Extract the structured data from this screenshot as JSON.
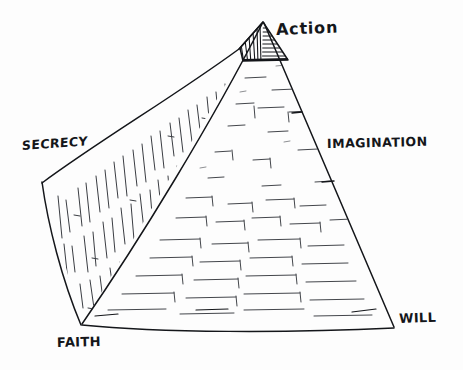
{
  "diagram": {
    "type": "pyramid",
    "style": "hand-drawn ink sketch",
    "background_color": "#fdfdfd",
    "ink_color": "#14161a",
    "labels": {
      "apex": "Action",
      "left_corner": "SECRECY",
      "right_face": "IMAGINATION",
      "bottom_left_corner": "FAITH",
      "bottom_right_corner": "WILL"
    },
    "vertices": {
      "apex": [
        263,
        22
      ],
      "left": [
        42,
        182
      ],
      "front_bottom": [
        82,
        325
      ],
      "right_bottom": [
        394,
        328
      ]
    },
    "capstone": {
      "present": true,
      "left_face_hatch": "vertical",
      "right_face_hatch": "horizontal",
      "base_y": 60
    },
    "faces": [
      {
        "name": "left-face",
        "texture": "vertical-dash-strokes"
      },
      {
        "name": "right-face",
        "texture": "horizontal-brick-courses"
      }
    ]
  }
}
